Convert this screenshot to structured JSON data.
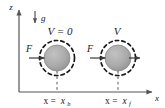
{
  "figure": {
    "type": "physics-diagram",
    "background_color": "#ffffff",
    "width": 165,
    "height": 108
  },
  "axes": {
    "vertical": {
      "label": "z",
      "direction": "up",
      "color": "#555555"
    },
    "horizontal": {
      "label": "x",
      "direction": "right",
      "color": "#555555"
    }
  },
  "gravity": {
    "label": "g",
    "direction": "down",
    "color": "#555555"
  },
  "bodies": [
    {
      "name": "sphere-initial",
      "potential_label": "V = 0",
      "position_label_prefix": "x =",
      "position_label_var": "x",
      "position_label_sub": "b",
      "force_label": "F",
      "force_direction": "right",
      "has_velocity_arrow": false,
      "fill_color": "#a8a8a8",
      "edge_color": "#8a8a8a",
      "dashed_ring_color": "#1a1a1a"
    },
    {
      "name": "sphere-final",
      "potential_label": "V",
      "position_label_prefix": "x =",
      "position_label_var": "x",
      "position_label_sub": "f",
      "force_label": "F",
      "force_direction": "right",
      "has_velocity_arrow": true,
      "fill_color": "#a8a8a8",
      "edge_color": "#8a8a8a",
      "dashed_ring_color": "#1a1a1a"
    }
  ]
}
